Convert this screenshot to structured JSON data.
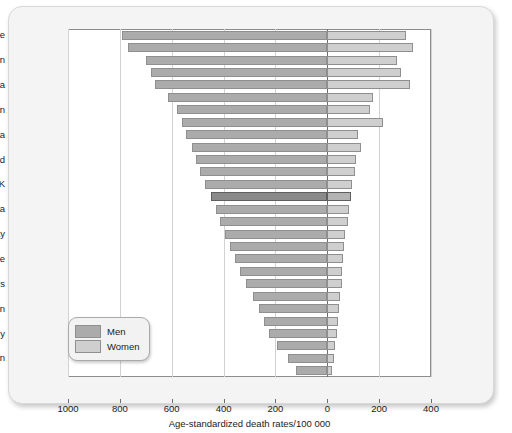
{
  "chart_data": {
    "type": "bar",
    "title": "",
    "subtitle": "",
    "orientation": "horizontal-diverging",
    "xlabel": "Age-standardized death rates/100 000",
    "ylabel": "",
    "grid": true,
    "legend_position": "bottom-left",
    "xlim": [
      -1000,
      400
    ],
    "xticks": [
      {
        "label": "1000",
        "value": -1000
      },
      {
        "label": "800",
        "value": -800
      },
      {
        "label": "600",
        "value": -600
      },
      {
        "label": "400",
        "value": -400
      },
      {
        "label": "200",
        "value": -200
      },
      {
        "label": "0",
        "value": 0
      },
      {
        "label": "200",
        "value": 200
      },
      {
        "label": "400",
        "value": 400
      }
    ],
    "legend": [
      {
        "name": "Men",
        "color": "#ababab"
      },
      {
        "name": "Women",
        "color": "#cfcfcf"
      }
    ],
    "visible_category_labels": [
      "Ukraine",
      "Kazakstan",
      "Estonia",
      "Krygyzstan",
      "Romania",
      "Ireland",
      "UK",
      "Austria",
      "Norway",
      "Greece",
      "Netherlands",
      "Spain",
      "Italy",
      "Japan"
    ],
    "note": "Each labelled country occupies every second bar row; intermediate unlabelled rows are additional countries.",
    "series": [
      {
        "name": "Men",
        "values": [
          790,
          770,
          700,
          680,
          665,
          615,
          580,
          560,
          545,
          520,
          505,
          490,
          470,
          450,
          430,
          415,
          395,
          375,
          355,
          335,
          315,
          285,
          265,
          245,
          225,
          195,
          150,
          120
        ]
      },
      {
        "name": "Women",
        "values": [
          305,
          330,
          270,
          285,
          320,
          175,
          165,
          215,
          120,
          130,
          110,
          105,
          95,
          90,
          85,
          80,
          70,
          65,
          60,
          58,
          55,
          50,
          45,
          42,
          38,
          30,
          25,
          18
        ]
      }
    ],
    "highlighted_row_index": 13,
    "bars": [
      {
        "label": "Ukraine",
        "men": 790,
        "women": 305,
        "highlight": false
      },
      {
        "label": "",
        "men": 770,
        "women": 330,
        "highlight": false
      },
      {
        "label": "Kazakstan",
        "men": 700,
        "women": 270,
        "highlight": false
      },
      {
        "label": "",
        "men": 680,
        "women": 285,
        "highlight": false
      },
      {
        "label": "Estonia",
        "men": 665,
        "women": 320,
        "highlight": false
      },
      {
        "label": "",
        "men": 615,
        "women": 175,
        "highlight": false
      },
      {
        "label": "Krygyzstan",
        "men": 580,
        "women": 165,
        "highlight": false
      },
      {
        "label": "",
        "men": 560,
        "women": 215,
        "highlight": false
      },
      {
        "label": "Romania",
        "men": 545,
        "women": 120,
        "highlight": false
      },
      {
        "label": "",
        "men": 520,
        "women": 130,
        "highlight": false
      },
      {
        "label": "Ireland",
        "men": 505,
        "women": 110,
        "highlight": false
      },
      {
        "label": "",
        "men": 490,
        "women": 105,
        "highlight": false
      },
      {
        "label": "UK",
        "men": 470,
        "women": 95,
        "highlight": false
      },
      {
        "label": "",
        "men": 450,
        "women": 90,
        "highlight": true
      },
      {
        "label": "Austria",
        "men": 430,
        "women": 85,
        "highlight": false
      },
      {
        "label": "",
        "men": 415,
        "women": 80,
        "highlight": false
      },
      {
        "label": "Norway",
        "men": 395,
        "women": 70,
        "highlight": false
      },
      {
        "label": "",
        "men": 375,
        "women": 65,
        "highlight": false
      },
      {
        "label": "Greece",
        "men": 355,
        "women": 60,
        "highlight": false
      },
      {
        "label": "",
        "men": 335,
        "women": 58,
        "highlight": false
      },
      {
        "label": "Netherlands",
        "men": 315,
        "women": 55,
        "highlight": false
      },
      {
        "label": "",
        "men": 285,
        "women": 50,
        "highlight": false
      },
      {
        "label": "Spain",
        "men": 265,
        "women": 45,
        "highlight": false
      },
      {
        "label": "",
        "men": 245,
        "women": 42,
        "highlight": false
      },
      {
        "label": "Italy",
        "men": 225,
        "women": 38,
        "highlight": false
      },
      {
        "label": "",
        "men": 195,
        "women": 30,
        "highlight": false
      },
      {
        "label": "Japan",
        "men": 150,
        "women": 25,
        "highlight": false
      },
      {
        "label": "",
        "men": 120,
        "women": 18,
        "highlight": false
      }
    ]
  }
}
